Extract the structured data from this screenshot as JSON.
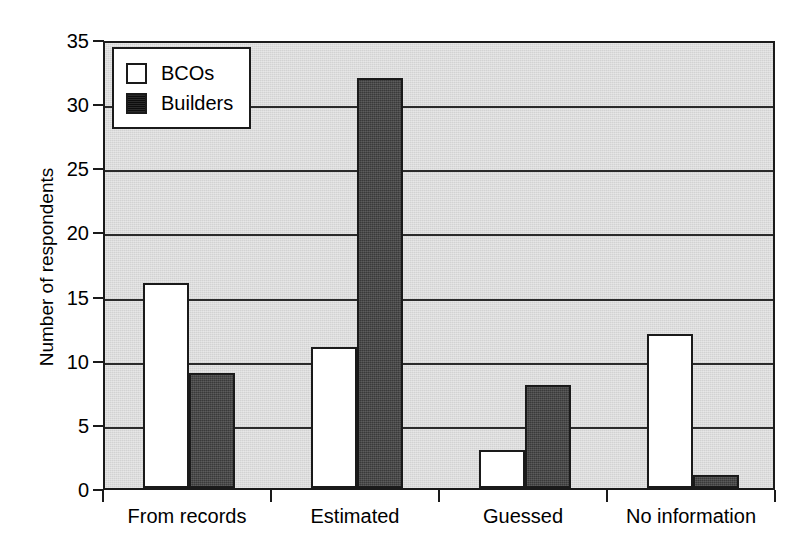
{
  "chart_data": {
    "type": "bar",
    "title": "",
    "subtitle": "",
    "xlabel": "",
    "ylabel": "Number of respondents",
    "categories": [
      "From records",
      "Estimated",
      "Guessed",
      "No information"
    ],
    "series": [
      {
        "name": "BCOs",
        "values": [
          16,
          11,
          3,
          12
        ],
        "color": "#ffffff"
      },
      {
        "name": "Builders",
        "values": [
          9,
          32,
          8,
          1
        ],
        "color": "#3a3a3a"
      }
    ],
    "ylim": [
      0,
      35
    ],
    "yticks": [
      0,
      5,
      10,
      15,
      20,
      25,
      30,
      35
    ],
    "ytick_labels": [
      "0",
      "5",
      "10",
      "15",
      "20",
      "25",
      "30",
      "35"
    ],
    "grid": true,
    "grid_axis": "y",
    "legend_position": "top-left",
    "plot_background": "#d2d2d2",
    "axis_color": "#1a1a1a"
  },
  "legend": {
    "items": [
      {
        "label": "BCOs",
        "swatch": "white-square-icon"
      },
      {
        "label": "Builders",
        "swatch": "black-square-icon"
      }
    ]
  },
  "axes": {
    "y_title": "Number of respondents"
  }
}
